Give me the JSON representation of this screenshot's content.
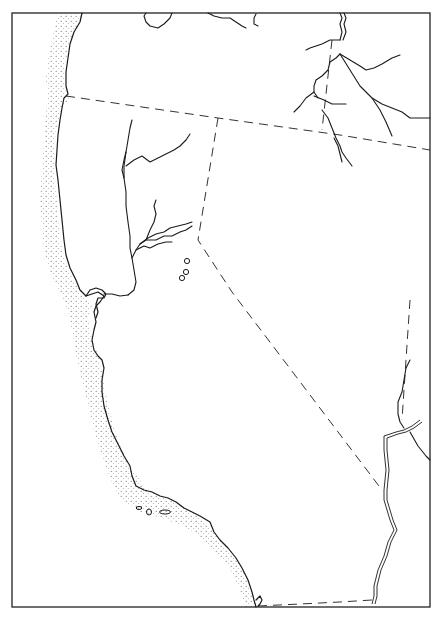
{
  "map": {
    "type": "outline base map",
    "region": "California, Nevada, southern Oregon",
    "frame": {
      "x": 12,
      "y": 13,
      "width": 418,
      "height": 594
    },
    "colors": {
      "ink": "#1a1a1a",
      "background": "#ffffff",
      "stipple": "#555555"
    },
    "features": [
      {
        "id": "pacific-coastline",
        "kind": "coastline",
        "style": "solid with stippled ocean margin"
      },
      {
        "id": "oregon-california-nevada-border",
        "kind": "state-boundary",
        "style": "dashed"
      },
      {
        "id": "california-nevada-border",
        "kind": "state-boundary",
        "style": "dashed"
      },
      {
        "id": "nevada-arizona-border",
        "kind": "state-boundary",
        "style": "dashed"
      },
      {
        "id": "mexico-border",
        "kind": "international-boundary",
        "style": "dashed"
      },
      {
        "id": "sacramento-river",
        "kind": "river",
        "style": "solid"
      },
      {
        "id": "american-feather-rivers",
        "kind": "river",
        "style": "solid"
      },
      {
        "id": "klamath-river",
        "kind": "river",
        "style": "solid"
      },
      {
        "id": "snake-tributaries",
        "kind": "river",
        "style": "solid"
      },
      {
        "id": "colorado-river",
        "kind": "river",
        "style": "double line"
      },
      {
        "id": "channel-islands",
        "kind": "islands",
        "style": "outlined"
      },
      {
        "id": "sierra-lakes",
        "kind": "lakes",
        "count": 3,
        "style": "small circles"
      }
    ]
  }
}
